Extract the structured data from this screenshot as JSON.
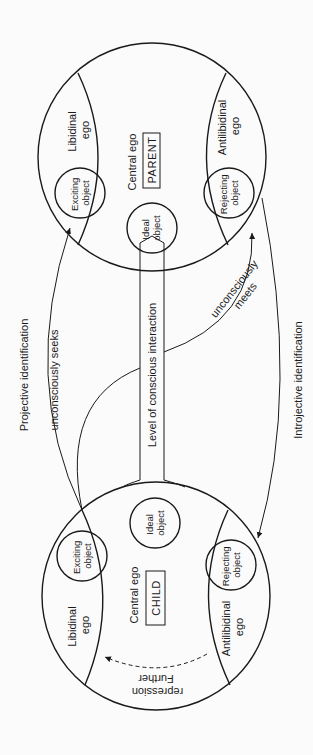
{
  "diagram": {
    "parent": {
      "central_ego": "Central ego",
      "box_label": "PARENT",
      "libidinal_ego": [
        "Libidinal",
        "ego"
      ],
      "antilibidinal_ego": [
        "Antilibidinal",
        "ego"
      ],
      "exciting_object": [
        "Exciting",
        "object"
      ],
      "rejecting_object": [
        "Rejecting",
        "object"
      ],
      "ideal_object": [
        "Ideal",
        "object"
      ]
    },
    "child": {
      "central_ego": "Central ego",
      "box_label": "CHILD",
      "libidinal_ego": [
        "Libidinal",
        "ego"
      ],
      "antilibidinal_ego": [
        "Antilibidinal",
        "ego"
      ],
      "exciting_object": [
        "Exciting",
        "object"
      ],
      "rejecting_object": [
        "Rejecting",
        "object"
      ],
      "ideal_object": [
        "Ideal",
        "object"
      ],
      "further_repression": [
        "Further",
        "repression"
      ]
    },
    "connector_label": "Level of conscious interaction",
    "arrows": {
      "projective": "Projective identification",
      "seeks": "unconsciously seeks",
      "meets": [
        "unconsciously",
        "meets"
      ],
      "introjective": "Introjective identification"
    }
  }
}
